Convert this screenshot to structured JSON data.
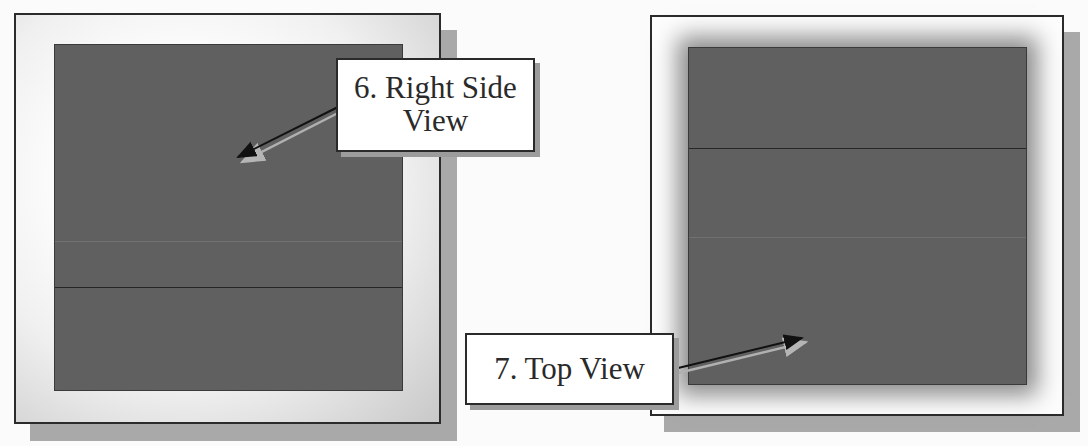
{
  "figure": {
    "panels": [
      {
        "id": "right-side-view-panel",
        "callout": {
          "number": "6.",
          "line1": "6. Right Side",
          "line2": "View"
        }
      },
      {
        "id": "top-view-panel",
        "callout": {
          "number": "7.",
          "line1": "7. Top View"
        }
      }
    ],
    "colors": {
      "background": "#fbfbfb",
      "frame_border": "#2b2b2b",
      "frame_shadow": "#a9a9a9",
      "viewport_fill": "#606060",
      "edge_line": "#2a2a2a",
      "callout_fill": "#ffffff"
    }
  }
}
